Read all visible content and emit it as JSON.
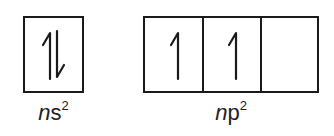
{
  "orbitals": [
    {
      "name": "ns",
      "label_italic": "n",
      "label_rest": "s",
      "superscript": "2",
      "cells": [
        {
          "electrons": "up-down"
        }
      ]
    },
    {
      "name": "np",
      "label_italic": "n",
      "label_rest": "p",
      "superscript": "2",
      "cells": [
        {
          "electrons": "up"
        },
        {
          "electrons": "up"
        },
        {
          "electrons": "empty"
        }
      ]
    }
  ],
  "colors": {
    "line": "#1a1a1a",
    "text": "#222222",
    "background": "#ffffff"
  }
}
